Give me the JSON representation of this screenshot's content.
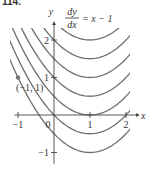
{
  "problem_number": "114.",
  "chart_data": {
    "type": "line",
    "equation": {
      "numerator": "dy",
      "denominator": "dx",
      "rhs": "= x − 1"
    },
    "xlabel": "x",
    "ylabel": "y",
    "xlim": [
      -1.1,
      2.1
    ],
    "ylim": [
      -1.3,
      2.4
    ],
    "x_ticks": [
      -1,
      0,
      1,
      2
    ],
    "x_tick_labels": [
      "−1",
      "0",
      "1",
      "2"
    ],
    "y_ticks": [
      -1,
      1,
      2
    ],
    "y_tick_labels": [
      "−1",
      "1",
      "2"
    ],
    "grid": false,
    "series": [
      {
        "name": "C=-0.5",
        "C": -0.5
      },
      {
        "name": "C=0",
        "C": 0
      },
      {
        "name": "C=0.5",
        "C": 0.5
      },
      {
        "name": "C=1",
        "C": 1
      },
      {
        "name": "C=1.5",
        "C": 1.5
      },
      {
        "name": "C=2",
        "C": 2
      },
      {
        "name": "C=2.5",
        "C": 2.5
      },
      {
        "name": "C=3",
        "C": 3
      },
      {
        "name": "C=3.5",
        "C": 3.5
      },
      {
        "name": "C=4",
        "C": 4
      }
    ],
    "annotations": [
      {
        "type": "point",
        "x": -1,
        "y": 1,
        "label": "(−1, 1)"
      }
    ]
  }
}
